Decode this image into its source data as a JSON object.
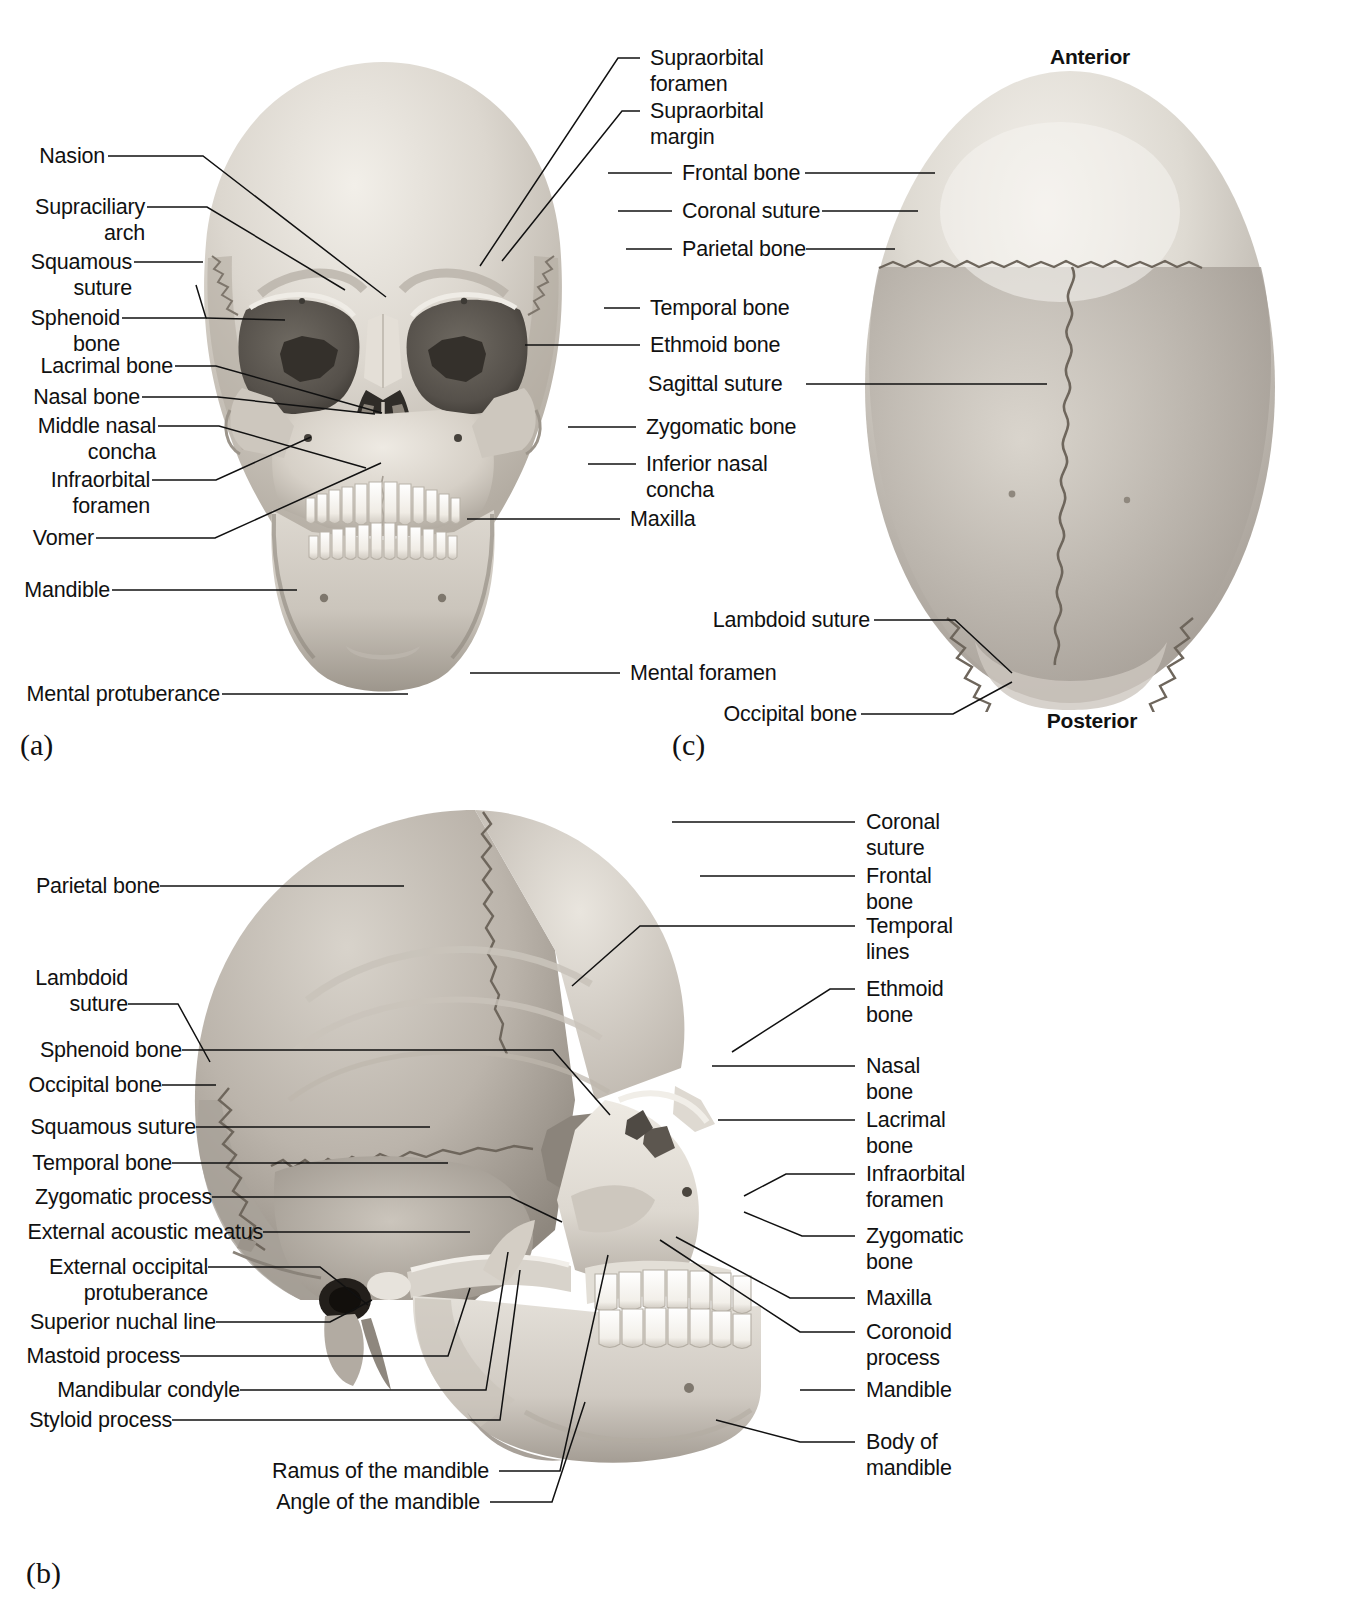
{
  "panels": [
    {
      "tag": "(a)",
      "name": "anterior-view"
    },
    {
      "tag": "(b)",
      "name": "lateral-view"
    },
    {
      "tag": "(c)",
      "name": "superior-view"
    }
  ],
  "orientation": {
    "anterior": "Anterior",
    "posterior": "Posterior"
  },
  "panel_a": {
    "left_labels": [
      "Nasion",
      "Supraciliary\narch",
      "Squamous\nsuture",
      "Sphenoid\nbone",
      "Lacrimal bone",
      "Nasal bone",
      "Middle nasal\nconcha",
      "Infraorbital\nforamen",
      "Vomer",
      "Mandible",
      "Mental protuberance"
    ],
    "right_labels": [
      "Supraorbital\nforamen",
      "Supraorbital\nmargin",
      "Frontal bone",
      "Coronal suture",
      "Parietal bone",
      "Temporal bone",
      "Ethmoid bone",
      "Zygomatic bone",
      "Inferior nasal\nconcha",
      "Maxilla",
      "Mental foramen"
    ]
  },
  "panel_c": {
    "shared_labels": [
      "Frontal bone",
      "Coronal suture",
      "Parietal bone",
      "Sagittal suture"
    ],
    "labels": [
      "Lambdoid suture",
      "Occipital bone"
    ]
  },
  "panel_b": {
    "left_labels": [
      "Parietal bone",
      "Lambdoid\nsuture",
      "Sphenoid bone",
      "Occipital bone",
      "Squamous suture",
      "Temporal bone",
      "Zygomatic process",
      "External acoustic meatus",
      "External occipital\nprotuberance",
      "Superior nuchal line",
      "Mastoid process",
      "Mandibular condyle",
      "Styloid process",
      "Ramus of the mandible",
      "Angle of the mandible"
    ],
    "right_labels": [
      "Coronal\nsuture",
      "Frontal\nbone",
      "Temporal\nlines",
      "Ethmoid\nbone",
      "Nasal\nbone",
      "Lacrimal\nbone",
      "Infraorbital\nforamen",
      "Zygomatic\nbone",
      "Maxilla",
      "Coronoid\nprocess",
      "Mandible",
      "Body of\nmandible"
    ]
  },
  "colors": {
    "line": "#111111",
    "text": "#111111",
    "bone_light": "#e8e4de",
    "bone_mid": "#c9c3bb",
    "bone_dark": "#9b948b",
    "cavity": "#4a4640",
    "tooth": "#fbfaf7",
    "background": "#ffffff"
  }
}
